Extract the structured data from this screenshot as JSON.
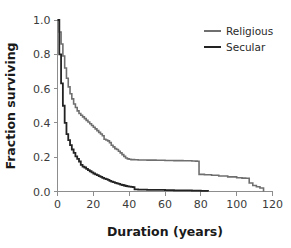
{
  "chart_data": {
    "type": "line",
    "title": "",
    "subtitle": "",
    "xlabel": "Duration (years)",
    "ylabel": "Fraction surviving",
    "xlim": [
      0,
      120
    ],
    "ylim": [
      0.0,
      1.0
    ],
    "xticks": [
      0,
      20,
      40,
      60,
      80,
      100,
      120
    ],
    "xtick_labels": [
      "0",
      "20",
      "40",
      "60",
      "80",
      "100",
      "120"
    ],
    "yticks": [
      0.0,
      0.2,
      0.4,
      0.6,
      0.8,
      1.0
    ],
    "ytick_labels": [
      "0.0",
      "0.2",
      "0.4",
      "0.6",
      "0.8",
      "1.0"
    ],
    "grid": false,
    "legend_position": "top-right",
    "series": [
      {
        "name": "Religious",
        "color": "#6f6f6f",
        "linewidth": 1.6,
        "style": "step",
        "x": [
          0,
          1,
          2,
          3,
          4,
          5,
          6,
          7,
          8,
          9,
          10,
          11,
          12,
          13,
          14,
          15,
          16,
          17,
          18,
          19,
          20,
          21,
          22,
          23,
          24,
          25,
          26,
          27,
          28,
          29,
          30,
          31,
          32,
          33,
          34,
          35,
          36,
          37,
          38,
          39,
          40,
          41,
          43,
          45,
          50,
          55,
          60,
          65,
          70,
          75,
          77,
          78,
          79,
          82,
          86,
          90,
          95,
          100,
          103,
          105,
          107,
          109,
          111,
          113,
          115
        ],
        "y": [
          1.0,
          0.93,
          0.86,
          0.79,
          0.72,
          0.66,
          0.61,
          0.57,
          0.54,
          0.51,
          0.49,
          0.47,
          0.455,
          0.445,
          0.435,
          0.425,
          0.415,
          0.405,
          0.395,
          0.385,
          0.375,
          0.365,
          0.355,
          0.345,
          0.335,
          0.325,
          0.305,
          0.3,
          0.295,
          0.285,
          0.27,
          0.26,
          0.25,
          0.245,
          0.235,
          0.225,
          0.215,
          0.205,
          0.195,
          0.19,
          0.188,
          0.186,
          0.185,
          0.184,
          0.183,
          0.182,
          0.181,
          0.18,
          0.179,
          0.178,
          0.177,
          0.176,
          0.1,
          0.098,
          0.095,
          0.09,
          0.085,
          0.08,
          0.078,
          0.077,
          0.05,
          0.035,
          0.028,
          0.02,
          0.0
        ]
      },
      {
        "name": "Secular",
        "color": "#232323",
        "linewidth": 1.8,
        "style": "step",
        "x": [
          0,
          1,
          2,
          3,
          4,
          5,
          6,
          7,
          8,
          9,
          10,
          11,
          12,
          13,
          14,
          15,
          16,
          17,
          18,
          19,
          20,
          21,
          22,
          23,
          24,
          25,
          26,
          27,
          28,
          29,
          30,
          31,
          32,
          33,
          34,
          35,
          36,
          37,
          38,
          39,
          40,
          41,
          42,
          43,
          45,
          50,
          55,
          60,
          65,
          70,
          75,
          80,
          84
        ],
        "y": [
          1.0,
          0.8,
          0.63,
          0.5,
          0.4,
          0.335,
          0.3,
          0.27,
          0.245,
          0.225,
          0.205,
          0.19,
          0.175,
          0.155,
          0.145,
          0.14,
          0.132,
          0.125,
          0.118,
          0.112,
          0.105,
          0.1,
          0.095,
          0.09,
          0.085,
          0.08,
          0.075,
          0.072,
          0.068,
          0.062,
          0.058,
          0.055,
          0.05,
          0.047,
          0.044,
          0.04,
          0.038,
          0.035,
          0.032,
          0.03,
          0.028,
          0.027,
          0.026,
          0.012,
          0.011,
          0.01,
          0.009,
          0.008,
          0.007,
          0.006,
          0.005,
          0.004,
          0.0
        ]
      }
    ],
    "legend": [
      {
        "label": "Religious",
        "color": "#6f6f6f"
      },
      {
        "label": "Secular",
        "color": "#232323"
      }
    ]
  },
  "figure": {
    "background": "#ffffff",
    "axis_color": "#8d8d8d"
  }
}
